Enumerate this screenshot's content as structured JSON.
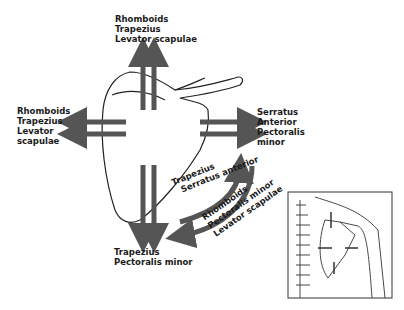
{
  "diagram": {
    "colors": {
      "arrow": "#555555",
      "outline": "#222222",
      "background": "#ffffff"
    },
    "labels": {
      "top": [
        "Rhomboids",
        "Trapezius",
        "Levator scapulae"
      ],
      "left": [
        "Rhomboids",
        "Trapezius",
        "Levator",
        "scapulae"
      ],
      "right": [
        "Serratus",
        "Anterior",
        "Pectoralis",
        "minor"
      ],
      "bottom": [
        "Trapezius",
        "Pectoralis minor"
      ],
      "rotation_upward": [
        "Trapezius",
        "Serratus anterior"
      ],
      "rotation_downward": [
        "Rhomboids",
        "Pectoralis minor",
        "Levator scapulae"
      ]
    },
    "inset": {
      "description": "Posterior view of spine and scapula with movement arrows"
    }
  }
}
